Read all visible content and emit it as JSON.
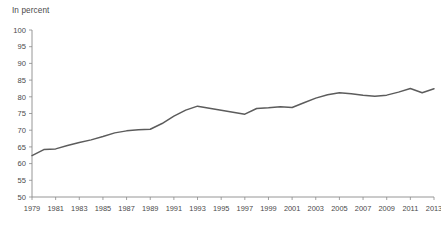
{
  "chart_data": {
    "type": "line",
    "title": "",
    "subtitle": "",
    "xlabel": "",
    "ylabel": "In percent",
    "unit_label": "In percent",
    "xlim": [
      1979,
      2013
    ],
    "ylim": [
      50,
      100
    ],
    "grid": false,
    "legend": null,
    "legend_position": "none",
    "y_ticks": [
      50,
      55,
      60,
      65,
      70,
      75,
      80,
      85,
      90,
      95,
      100
    ],
    "y_tick_labels": [
      "50",
      "55",
      "60",
      "65",
      "70",
      "75",
      "80",
      "85",
      "90",
      "95",
      "100"
    ],
    "x_ticks": [
      1979,
      1981,
      1983,
      1985,
      1987,
      1989,
      1991,
      1993,
      1995,
      1997,
      1999,
      2001,
      2003,
      2005,
      2007,
      2009,
      2011,
      2013
    ],
    "x_tick_labels": [
      "1979",
      "1981",
      "1983",
      "1985",
      "1987",
      "1989",
      "1991",
      "1993",
      "1995",
      "1997",
      "1999",
      "2001",
      "2003",
      "2005",
      "2007",
      "2009",
      "2011",
      "2013"
    ],
    "x": [
      1979,
      1980,
      1981,
      1982,
      1983,
      1984,
      1985,
      1986,
      1987,
      1988,
      1989,
      1990,
      1991,
      1992,
      1993,
      1994,
      1995,
      1996,
      1997,
      1998,
      1999,
      2000,
      2001,
      2002,
      2003,
      2004,
      2005,
      2006,
      2007,
      2008,
      2009,
      2010,
      2011,
      2012,
      2013
    ],
    "values": [
      62.4,
      64.2,
      64.4,
      65.4,
      66.3,
      67.1,
      68.1,
      69.2,
      69.8,
      70.1,
      70.3,
      72.0,
      74.2,
      76.0,
      77.2,
      76.6,
      76.0,
      75.4,
      74.8,
      76.5,
      76.7,
      77.0,
      76.8,
      78.2,
      79.6,
      80.6,
      81.2,
      80.9,
      80.5,
      80.2,
      80.5,
      81.4,
      82.5,
      81.2,
      82.4
    ],
    "series": [
      {
        "name": "",
        "color": "#5c5c5c",
        "values": [
          62.4,
          64.2,
          64.4,
          65.4,
          66.3,
          67.1,
          68.1,
          69.2,
          69.8,
          70.1,
          70.3,
          72.0,
          74.2,
          76.0,
          77.2,
          76.6,
          76.0,
          75.4,
          74.8,
          76.5,
          76.7,
          77.0,
          76.8,
          78.2,
          79.6,
          80.6,
          81.2,
          80.9,
          80.5,
          80.2,
          80.5,
          81.4,
          82.5,
          81.2,
          82.4
        ]
      }
    ],
    "colors": {
      "line": "#5c5c5c",
      "axis": "#8a8a8a",
      "text": "#4a4a4a",
      "background": "#ffffff"
    }
  }
}
